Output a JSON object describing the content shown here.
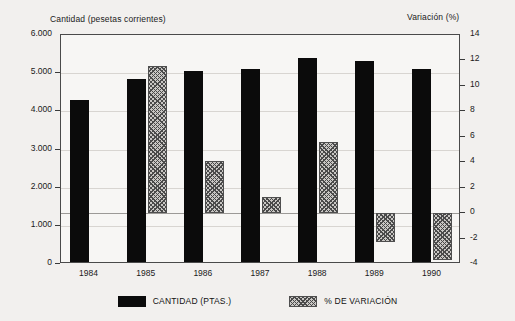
{
  "chart_data": {
    "type": "bar",
    "title": "",
    "subtitle": "",
    "categories": [
      "1984",
      "1985",
      "1986",
      "1987",
      "1988",
      "1989",
      "1990"
    ],
    "xlabel": "",
    "left_axis": {
      "label": "Cantidad (pesetas corrientes)",
      "ticks": [
        "0",
        "1.000",
        "2.000",
        "3.000",
        "4.000",
        "5.000",
        "6.000"
      ],
      "tick_values": [
        0,
        1000,
        2000,
        3000,
        4000,
        5000,
        6000
      ],
      "ylim": [
        0,
        6000
      ]
    },
    "right_axis": {
      "label": "Variación (%)",
      "ticks": [
        "-4",
        "-2",
        "0",
        "2",
        "4",
        "6",
        "8",
        "10",
        "12",
        "14"
      ],
      "tick_values": [
        -4,
        -2,
        0,
        2,
        4,
        6,
        8,
        10,
        12,
        14
      ],
      "ylim": [
        -4,
        14
      ]
    },
    "grid": true,
    "legend_position": "bottom",
    "series": [
      {
        "name": "CANTIDAD (PTAS.)",
        "axis": "left",
        "color": "#0b0b0b",
        "fill": "solid",
        "values": [
          4300,
          4850,
          5050,
          5100,
          5400,
          5320,
          5120
        ]
      },
      {
        "name": "% DE VARIACIÓN",
        "axis": "right",
        "color": "#c9c7c4",
        "fill": "hatched",
        "values": [
          null,
          11.6,
          4.1,
          1.3,
          5.6,
          -2.3,
          -3.7
        ]
      }
    ]
  },
  "legend": {
    "items": [
      {
        "label": "CANTIDAD (PTAS.)",
        "swatch": "solid-black"
      },
      {
        "label": "% DE VARIACIÓN",
        "swatch": "hatched-gray"
      }
    ]
  }
}
